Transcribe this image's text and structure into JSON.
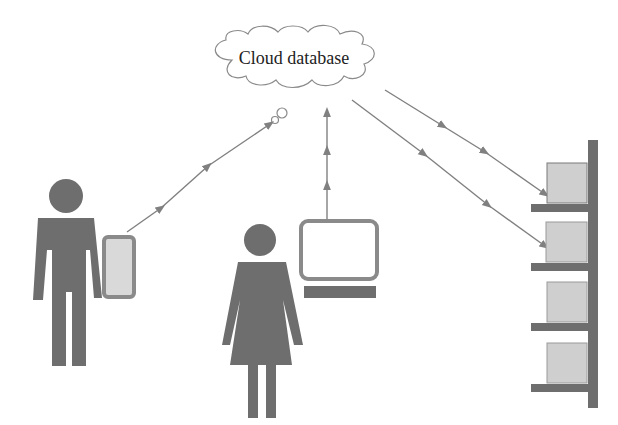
{
  "diagram": {
    "cloud": {
      "label": "Cloud database"
    },
    "nodes": [
      {
        "id": "man-with-tablet",
        "type": "person-male",
        "device": "tablet"
      },
      {
        "id": "woman-with-computer",
        "type": "person-female",
        "device": "computer"
      },
      {
        "id": "storage-shelf",
        "type": "shelf",
        "boxes": 4
      }
    ],
    "edges": [
      {
        "from": "tablet",
        "to": "cloud",
        "direction": "up"
      },
      {
        "from": "computer",
        "to": "cloud",
        "direction": "up"
      },
      {
        "from": "cloud",
        "to": "shelf-box-1",
        "direction": "down"
      },
      {
        "from": "cloud",
        "to": "shelf-box-2",
        "direction": "down"
      }
    ],
    "colors": {
      "figure": "#6e6e6e",
      "device_frame": "#8a8a8a",
      "device_screen": "#d9d9d9",
      "box_fill": "#cfcfcf",
      "arrow": "#808080",
      "cloud_stroke": "#8a8a8a"
    }
  }
}
